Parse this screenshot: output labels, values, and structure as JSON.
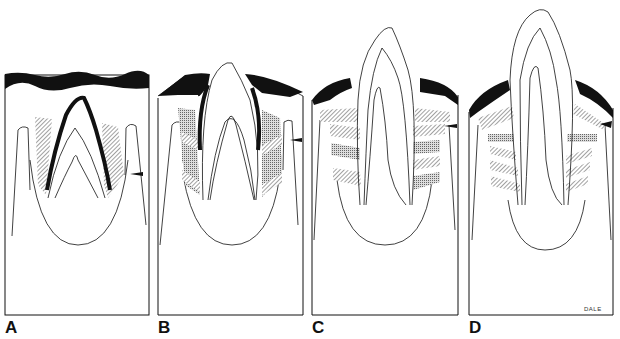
{
  "figure": {
    "panels": [
      {
        "id": "A",
        "label": "A"
      },
      {
        "id": "B",
        "label": "B"
      },
      {
        "id": "C",
        "label": "C"
      },
      {
        "id": "D",
        "label": "D"
      }
    ],
    "signature": "DALE",
    "colors": {
      "ink": "#111111",
      "background": "#ffffff",
      "hatch": "#777777"
    }
  }
}
